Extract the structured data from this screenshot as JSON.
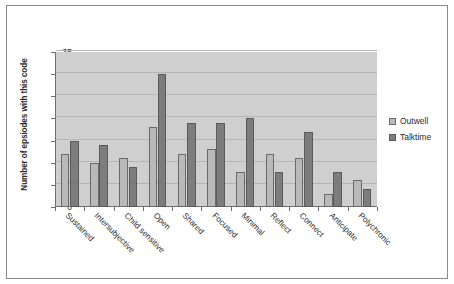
{
  "chart_data": {
    "type": "bar",
    "title": "",
    "xlabel": "",
    "ylabel": "Number of epsiodes with this code",
    "ylim": [
      0,
      35
    ],
    "ytick_step": 5,
    "yticks": [
      0,
      5,
      10,
      15,
      20,
      25,
      30,
      35
    ],
    "grid": true,
    "legend_position": "right",
    "categories": [
      "Sustained",
      "Intersubjective",
      "Child sensitive",
      "Open",
      "Shared",
      "Focused",
      "Minimal",
      "Reflect",
      "Connect",
      "Anticipate",
      "Polychronic"
    ],
    "series": [
      {
        "name": "Outwell",
        "color": "#b9b9b9",
        "values": [
          12,
          10,
          11,
          18,
          12,
          13,
          8,
          12,
          11,
          3,
          6
        ]
      },
      {
        "name": "Talktime",
        "color": "#7d7d7d",
        "values": [
          15,
          14,
          9,
          30,
          19,
          19,
          20,
          8,
          17,
          8,
          4
        ]
      }
    ]
  },
  "legend": {
    "items": [
      {
        "label": "Outwell"
      },
      {
        "label": "Talktime"
      }
    ]
  }
}
